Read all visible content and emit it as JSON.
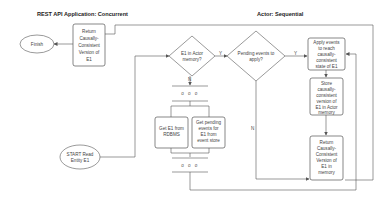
{
  "diagram": {
    "type": "flowchart",
    "lanes": [
      {
        "id": "rest",
        "title": "REST API Application: Concurrent"
      },
      {
        "id": "actor",
        "title": "Actor: Sequential"
      }
    ],
    "nodes": {
      "finish": {
        "shape": "terminator",
        "lines": [
          "Finish"
        ]
      },
      "return_left": {
        "shape": "process",
        "lines": [
          "Return",
          "Causally-",
          "Consistent",
          "Version of",
          "E1"
        ]
      },
      "decision_memory": {
        "shape": "decision",
        "lines": [
          "E1 in Actor",
          "memory?"
        ]
      },
      "decision_pending": {
        "shape": "decision",
        "lines": [
          "Pending events to",
          "apply?"
        ]
      },
      "apply_events": {
        "shape": "process",
        "lines": [
          "Apply events",
          "to reach",
          "causally-",
          "consistent",
          "state of E1"
        ]
      },
      "store": {
        "shape": "process",
        "lines": [
          "Store",
          "causally-",
          "consistent",
          "version of",
          "E1 in Actor",
          "memory"
        ]
      },
      "return_right": {
        "shape": "process",
        "lines": [
          "Return",
          "Causally-",
          "Consistent",
          "Version of",
          "E1 in",
          "memory"
        ]
      },
      "fork": {
        "shape": "parallel",
        "label": "o o o"
      },
      "get_rdbms": {
        "shape": "process",
        "lines": [
          "Get E1 from",
          "RDBMS"
        ]
      },
      "get_pending": {
        "shape": "process",
        "lines": [
          "Get pending",
          "events for",
          "E1 from",
          "event store"
        ]
      },
      "join": {
        "shape": "parallel",
        "label": "o o o"
      },
      "start": {
        "shape": "terminator",
        "lines": [
          "START Read",
          "Entity E1"
        ]
      }
    },
    "edge_labels": {
      "memory_yes": "Y",
      "memory_no": "N",
      "pending_yes": "Y",
      "pending_no": "N"
    },
    "colors": {
      "stroke": "#555555",
      "text": "#444444",
      "background": "#ffffff"
    }
  }
}
